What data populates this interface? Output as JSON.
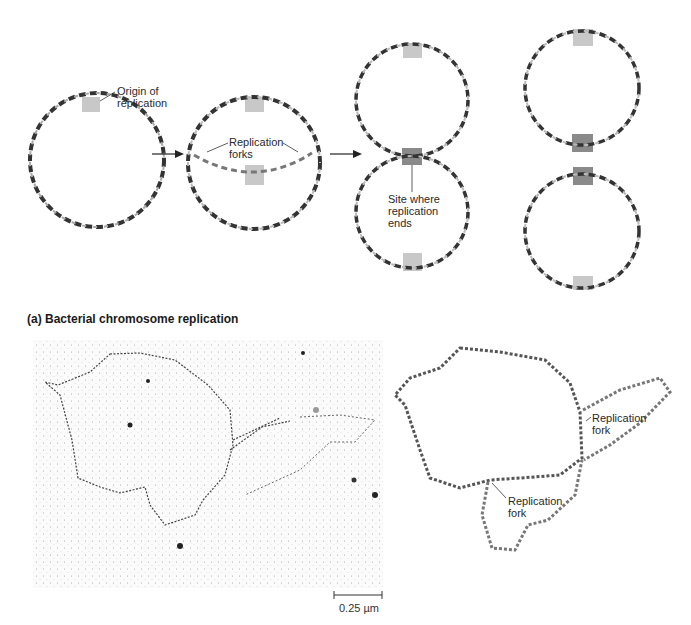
{
  "panel_a": {
    "labels": {
      "origin": [
        "Origin of",
        "replication"
      ],
      "forks": [
        "Replication",
        "forks"
      ],
      "site_end": [
        "Site where",
        "replication",
        "ends"
      ]
    },
    "caption": "(a) Bacterial chromosome replication",
    "colors": {
      "dna_dark": "#333333",
      "dna_light": "#bdbdbd",
      "origin_box": "#c8c8c8",
      "terminus_box": "#8a8a8a"
    }
  },
  "panel_b": {
    "micrograph_scale": "0.25 µm",
    "labels": {
      "fork_upper": [
        "Replication",
        "fork"
      ],
      "fork_lower": [
        "Replication",
        "fork"
      ]
    }
  }
}
